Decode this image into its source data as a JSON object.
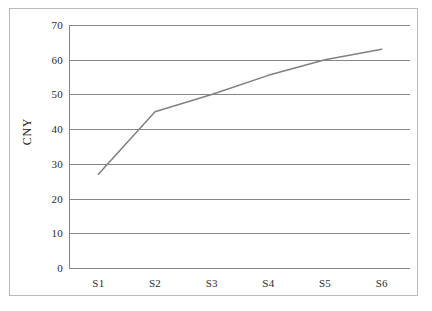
{
  "chart_data": {
    "type": "line",
    "title": "",
    "subtitle": "",
    "xlabel": "",
    "ylabel": "CNY",
    "categories": [
      "S1",
      "S2",
      "S3",
      "S4",
      "S5",
      "S6"
    ],
    "series": [
      {
        "name": "CNY",
        "values": [
          27,
          45,
          50,
          55.5,
          60,
          63
        ],
        "color": "#808080",
        "marker": "none",
        "line_width": 1.5
      }
    ],
    "ylim": [
      0,
      70
    ],
    "y_ticks": [
      0,
      10,
      20,
      30,
      40,
      50,
      60,
      70
    ],
    "y_tick_labels": [
      "0",
      "10",
      "20",
      "30",
      "40",
      "50",
      "60",
      "70"
    ],
    "x_tick_labels": [
      "S1",
      "S2",
      "S3",
      "S4",
      "S5",
      "S6"
    ],
    "grid": {
      "horizontal": true,
      "vertical": false,
      "color": "#868686"
    },
    "legend": {
      "visible": false,
      "position": "none",
      "entries": []
    },
    "axis_color": "#868686",
    "background_color": "#ffffff",
    "border_color": "#b9b9b9",
    "annotations": []
  }
}
